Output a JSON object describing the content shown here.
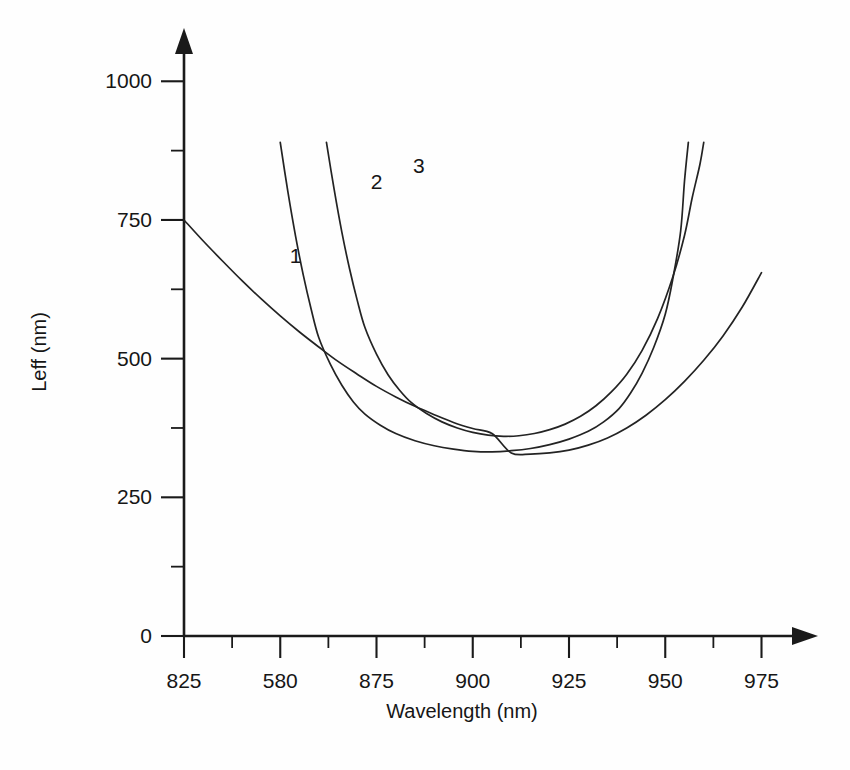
{
  "chart_data": {
    "type": "line",
    "title": "",
    "xlabel": "Wavelength (nm)",
    "ylabel": "Leff (nm)",
    "xlim": [
      825,
      985
    ],
    "ylim": [
      0,
      1060
    ],
    "grid": false,
    "legend_position": "inline-curve-labels",
    "x_ticks": [
      {
        "value": 825,
        "label": "825",
        "type": "major"
      },
      {
        "value": 850,
        "label": "580",
        "type": "major"
      },
      {
        "value": 875,
        "label": "875",
        "type": "major"
      },
      {
        "value": 900,
        "label": "900",
        "type": "major"
      },
      {
        "value": 925,
        "label": "925",
        "type": "major"
      },
      {
        "value": 950,
        "label": "950",
        "type": "major"
      },
      {
        "value": 975,
        "label": "975",
        "type": "major"
      }
    ],
    "x_minor_ticks": [
      837.5,
      862.5,
      887.5,
      912.5,
      937.5,
      962.5
    ],
    "y_ticks": [
      {
        "value": 0,
        "label": "0",
        "type": "major"
      },
      {
        "value": 250,
        "label": "250",
        "type": "major"
      },
      {
        "value": 500,
        "label": "500",
        "type": "major"
      },
      {
        "value": 750,
        "label": "750",
        "type": "major"
      },
      {
        "value": 1000,
        "label": "1000",
        "type": "major"
      }
    ],
    "y_minor_ticks": [
      125,
      375,
      625,
      875
    ],
    "series": [
      {
        "name": "1",
        "label": "1",
        "label_x": 854,
        "label_y": 672,
        "points": [
          [
            825,
            750
          ],
          [
            830,
            712
          ],
          [
            835,
            676
          ],
          [
            840,
            641
          ],
          [
            845,
            608
          ],
          [
            850,
            577
          ],
          [
            855,
            548
          ],
          [
            860,
            521
          ],
          [
            865,
            495
          ],
          [
            870,
            472
          ],
          [
            875,
            450
          ],
          [
            880,
            431
          ],
          [
            885,
            414
          ],
          [
            890,
            399
          ],
          [
            895,
            385
          ],
          [
            900,
            374
          ],
          [
            905,
            365
          ],
          [
            910,
            330
          ],
          [
            915,
            328
          ],
          [
            920,
            330
          ],
          [
            925,
            335
          ],
          [
            930,
            344
          ],
          [
            935,
            357
          ],
          [
            940,
            375
          ],
          [
            945,
            398
          ],
          [
            950,
            426
          ],
          [
            955,
            459
          ],
          [
            960,
            497
          ],
          [
            965,
            541
          ],
          [
            970,
            593
          ],
          [
            975,
            655
          ]
        ]
      },
      {
        "name": "2",
        "label": "2",
        "label_x": 875,
        "label_y": 806,
        "points": [
          [
            850,
            890
          ],
          [
            852,
            800
          ],
          [
            854,
            720
          ],
          [
            856,
            650
          ],
          [
            858,
            590
          ],
          [
            860,
            538
          ],
          [
            863,
            490
          ],
          [
            866,
            452
          ],
          [
            869,
            422
          ],
          [
            872,
            400
          ],
          [
            876,
            380
          ],
          [
            880,
            365
          ],
          [
            885,
            352
          ],
          [
            890,
            343
          ],
          [
            895,
            337
          ],
          [
            900,
            333
          ],
          [
            905,
            332
          ],
          [
            910,
            334
          ],
          [
            915,
            338
          ],
          [
            920,
            345
          ],
          [
            925,
            355
          ],
          [
            930,
            369
          ],
          [
            934,
            386
          ],
          [
            938,
            410
          ],
          [
            941,
            438
          ],
          [
            944,
            474
          ],
          [
            947,
            520
          ],
          [
            950,
            580
          ],
          [
            952,
            645
          ],
          [
            954,
            730
          ],
          [
            955,
            820
          ],
          [
            956,
            890
          ]
        ]
      },
      {
        "name": "3",
        "label": "3",
        "label_x": 886,
        "label_y": 835,
        "points": [
          [
            862,
            890
          ],
          [
            864,
            805
          ],
          [
            866,
            728
          ],
          [
            868,
            662
          ],
          [
            870,
            605
          ],
          [
            872,
            556
          ],
          [
            875,
            508
          ],
          [
            878,
            471
          ],
          [
            881,
            443
          ],
          [
            884,
            421
          ],
          [
            888,
            401
          ],
          [
            892,
            386
          ],
          [
            896,
            375
          ],
          [
            900,
            367
          ],
          [
            904,
            362
          ],
          [
            908,
            360
          ],
          [
            912,
            361
          ],
          [
            916,
            365
          ],
          [
            920,
            372
          ],
          [
            924,
            382
          ],
          [
            928,
            396
          ],
          [
            932,
            415
          ],
          [
            936,
            440
          ],
          [
            940,
            472
          ],
          [
            944,
            515
          ],
          [
            948,
            572
          ],
          [
            952,
            648
          ],
          [
            955,
            722
          ],
          [
            957,
            790
          ],
          [
            959,
            850
          ],
          [
            960,
            890
          ]
        ]
      }
    ]
  },
  "axes": {
    "x_axis_name": "wavelength-axis",
    "y_axis_name": "leff-axis"
  }
}
